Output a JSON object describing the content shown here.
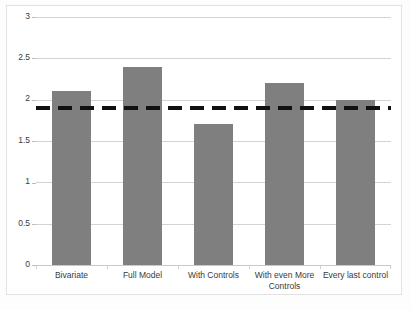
{
  "chart_data": {
    "type": "bar",
    "title": "",
    "subtitle": "",
    "xlabel": "",
    "ylabel": "",
    "categories": [
      "Bivariate",
      "Full Model",
      "With Controls",
      "With even More Controls",
      "Every last control"
    ],
    "values": [
      2.1,
      2.4,
      1.7,
      2.2,
      2.0
    ],
    "series": [
      {
        "name": "Estimate",
        "values": [
          2.1,
          2.4,
          1.7,
          2.2,
          2.0
        ],
        "color": "#7f7f7f"
      }
    ],
    "ylim": [
      0,
      3
    ],
    "ytick_labels": [
      "0",
      "0.5",
      "1",
      "1.5",
      "2",
      "2.5",
      "3"
    ],
    "ytick_values": [
      0,
      0.5,
      1,
      1.5,
      2,
      2.5,
      3
    ],
    "grid": true,
    "legend": false,
    "legend_position": "none",
    "annotations": [
      {
        "name": "reference-line",
        "type": "horizontal-dashed-line",
        "value": 1.9,
        "color": "#111111",
        "style": "dashed",
        "label": ""
      }
    ],
    "colors": {
      "bar": "#7f7f7f",
      "gridline": "#d3d3d3",
      "axis": "#bdbdbd",
      "reference_line": "#111111",
      "plot_background": "#ffffff",
      "frame_border": "#e2e2e2",
      "tick_label": "#3a3a3a"
    }
  }
}
